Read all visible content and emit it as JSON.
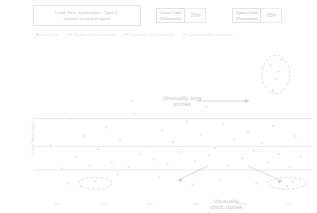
{
  "header": {
    "title_line1": "Lead Time Scatterplot - Type 1:",
    "title_line2": "release at end of sprint",
    "lower_limit": {
      "label_line1": "Lower Limit",
      "label_line2": "(Percentile)",
      "value": "20%"
    },
    "upper_limit": {
      "label_line1": "Upper Limit",
      "label_line2": "(Percentile)",
      "value": "85%"
    }
  },
  "legend": {
    "items": [
      {
        "label": "Lead Time",
        "marker": "dot"
      },
      {
        "label": "Median (50th percentile)",
        "marker": "line"
      },
      {
        "label": "Lead time 20th percentile",
        "marker": "line"
      },
      {
        "label": "Lead time 85th percentile",
        "marker": "line"
      }
    ]
  },
  "annotations": {
    "long_stories_line1": "Unusually long",
    "long_stories_line2": "stories",
    "short_stories_line1": "Unusually",
    "short_stories_line2": "short stories"
  },
  "chart_data": {
    "type": "scatter",
    "title": "Lead Time Scatterplot - Type 1: release at end of sprint",
    "xlabel": "Completion Date",
    "ylabel": "Lead Time (days)",
    "grid": false,
    "legend_position": "top",
    "xlim": [
      0,
      100
    ],
    "ylim": [
      0,
      100
    ],
    "xticks": [
      "Jan",
      "Feb",
      "Mar",
      "Apr",
      "May",
      "Jun"
    ],
    "series": [
      {
        "name": "Lead Time",
        "color": "#e3e6ea",
        "points": [
          [
            6,
            34
          ],
          [
            10,
            18
          ],
          [
            13,
            52
          ],
          [
            15,
            26
          ],
          [
            18,
            40
          ],
          [
            20,
            20
          ],
          [
            23,
            31
          ],
          [
            26,
            46
          ],
          [
            28,
            22
          ],
          [
            31,
            37
          ],
          [
            34,
            19
          ],
          [
            36,
            55
          ],
          [
            38,
            28
          ],
          [
            41,
            33
          ],
          [
            43,
            24
          ],
          [
            46,
            44
          ],
          [
            48,
            21
          ],
          [
            50,
            36
          ],
          [
            53,
            29
          ],
          [
            55,
            50
          ],
          [
            58,
            23
          ],
          [
            60,
            41
          ],
          [
            63,
            27
          ],
          [
            65,
            32
          ],
          [
            68,
            48
          ],
          [
            70,
            20
          ],
          [
            72,
            38
          ],
          [
            75,
            25
          ],
          [
            77,
            43
          ],
          [
            79,
            30
          ],
          [
            82,
            35
          ],
          [
            84,
            22
          ],
          [
            86,
            47
          ],
          [
            88,
            28
          ],
          [
            90,
            33
          ],
          [
            92,
            19
          ],
          [
            94,
            40
          ],
          [
            96,
            26
          ],
          [
            12,
            8
          ],
          [
            17,
            6
          ],
          [
            22,
            9
          ],
          [
            57,
            7
          ],
          [
            67,
            10
          ],
          [
            80,
            8
          ],
          [
            91,
            6
          ],
          [
            93,
            9
          ],
          [
            85,
            88
          ],
          [
            87,
            79
          ],
          [
            89,
            92
          ],
          [
            86,
            71
          ],
          [
            88,
            84
          ],
          [
            35,
            64
          ],
          [
            62,
            60
          ],
          [
            45,
            12
          ],
          [
            30,
            14
          ]
        ]
      }
    ],
    "reference_lines": [
      {
        "name": "Lead time 85th percentile",
        "y": 52,
        "color": "#e0e3e7"
      },
      {
        "name": "Median (50th percentile)",
        "y": 33,
        "color": "#e4e7eb"
      },
      {
        "name": "Lead time 20th percentile",
        "y": 17,
        "color": "#e0e3e7"
      }
    ],
    "highlight_ellipses": [
      {
        "name": "unusually-long-stories",
        "cx": 87,
        "cy": 82,
        "rx": 5,
        "ry": 13
      },
      {
        "name": "unusually-short-stories-left",
        "cx": 22,
        "cy": 8,
        "rx": 6,
        "ry": 4
      },
      {
        "name": "unusually-short-stories-right",
        "cx": 91,
        "cy": 8,
        "rx": 7,
        "ry": 4
      }
    ]
  }
}
